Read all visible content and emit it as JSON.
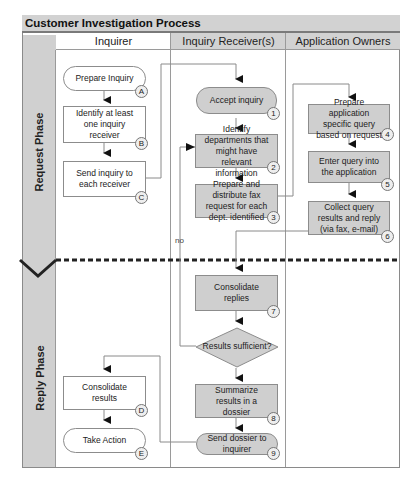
{
  "diagram": {
    "title": "Customer Investigation Process",
    "lanes": [
      {
        "label": "Inquirer"
      },
      {
        "label": "Inquiry Receiver(s)"
      },
      {
        "label": "Application Owners"
      }
    ],
    "phases": [
      {
        "label": "Request Phase"
      },
      {
        "label": "Reply Phase"
      }
    ],
    "nodes": {
      "A": {
        "text": "Prepare Inquiry",
        "badge": "A",
        "lane": "Inquirer",
        "shape": "terminator"
      },
      "B": {
        "text": "Identify at least one inquiry receiver",
        "badge": "B",
        "lane": "Inquirer",
        "shape": "process"
      },
      "C": {
        "text": "Send inquiry to each receiver",
        "badge": "C",
        "lane": "Inquirer",
        "shape": "process"
      },
      "n1": {
        "text": "Accept inquiry",
        "badge": "1",
        "lane": "Inquiry Receiver(s)",
        "shape": "terminator"
      },
      "n2": {
        "text": "Identify departments that might have relevant information",
        "badge": "2",
        "lane": "Inquiry Receiver(s)",
        "shape": "process"
      },
      "n3": {
        "text": "Prepare and distribute fax request for each dept. identified",
        "badge": "3",
        "lane": "Inquiry Receiver(s)",
        "shape": "process"
      },
      "n4": {
        "text": "Prepare application specific query based on request",
        "badge": "4",
        "lane": "Application Owners",
        "shape": "process"
      },
      "n5": {
        "text": "Enter query into the application",
        "badge": "5",
        "lane": "Application Owners",
        "shape": "process"
      },
      "n6": {
        "text": "Collect query results and reply (via fax, e-mail)",
        "badge": "6",
        "lane": "Application Owners",
        "shape": "process"
      },
      "n7": {
        "text": "Consolidate replies",
        "badge": "7",
        "lane": "Inquiry Receiver(s)",
        "shape": "process"
      },
      "decision": {
        "text": "Results sufficient?",
        "lane": "Inquiry Receiver(s)",
        "shape": "decision"
      },
      "n8": {
        "text": "Summarize results in a dossier",
        "badge": "8",
        "lane": "Inquiry Receiver(s)",
        "shape": "process"
      },
      "n9": {
        "text": "Send dossier to inquirer",
        "badge": "9",
        "lane": "Inquiry Receiver(s)",
        "shape": "terminator"
      },
      "D": {
        "text": "Consolidate results",
        "badge": "D",
        "lane": "Inquirer",
        "shape": "process"
      },
      "E": {
        "text": "Take Action",
        "badge": "E",
        "lane": "Inquirer",
        "shape": "terminator"
      }
    },
    "edges": [
      {
        "from": "A",
        "to": "B"
      },
      {
        "from": "B",
        "to": "C"
      },
      {
        "from": "C",
        "to": "n1"
      },
      {
        "from": "n1",
        "to": "n2"
      },
      {
        "from": "n2",
        "to": "n3"
      },
      {
        "from": "n3",
        "to": "n4"
      },
      {
        "from": "n4",
        "to": "n5"
      },
      {
        "from": "n5",
        "to": "n6"
      },
      {
        "from": "n6",
        "to": "n7"
      },
      {
        "from": "n7",
        "to": "decision"
      },
      {
        "from": "decision",
        "to": "n2",
        "label": "no"
      },
      {
        "from": "decision",
        "to": "n8"
      },
      {
        "from": "n8",
        "to": "n9"
      },
      {
        "from": "n9",
        "to": "D"
      },
      {
        "from": "D",
        "to": "E"
      }
    ],
    "no_label": "no"
  }
}
